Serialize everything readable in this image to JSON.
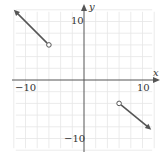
{
  "chart_data": {
    "type": "line",
    "title": "",
    "xlabel": "x",
    "ylabel": "y",
    "xlim": [
      -12,
      12
    ],
    "ylim": [
      -12,
      12
    ],
    "grid": true,
    "grid_step": 2,
    "x_tick_labels": [
      {
        "value": -10,
        "label": "−10"
      },
      {
        "value": 10,
        "label": "10"
      }
    ],
    "y_tick_labels": [
      {
        "value": 10,
        "label": "10"
      },
      {
        "value": -10,
        "label": "−10"
      }
    ],
    "series": [
      {
        "name": "left-ray",
        "points": [
          [
            -6,
            6
          ],
          [
            -12,
            12
          ]
        ],
        "start_marker": "open-circle",
        "end_marker": "arrow",
        "color": "#555555"
      },
      {
        "name": "right-ray",
        "points": [
          [
            6,
            -4
          ],
          [
            11.5,
            -8.5
          ]
        ],
        "start_marker": "open-circle",
        "end_marker": "arrow",
        "color": "#555555"
      }
    ],
    "legend": null
  },
  "labels": {
    "x_axis": "x",
    "y_axis": "y",
    "x_neg10": "−10",
    "x_pos10": "10",
    "y_pos10": "10",
    "y_neg10": "−10"
  }
}
